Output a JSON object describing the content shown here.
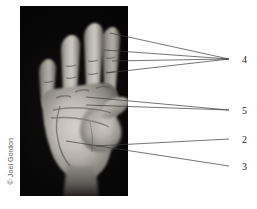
{
  "figure": {
    "kind": "anatomy-photograph",
    "credit": "© Joel Gordon",
    "background_color": "#ffffff",
    "photo": {
      "background_color": "#050505",
      "left": 20,
      "top": 6,
      "width": 108,
      "height": 190
    }
  },
  "callouts": [
    {
      "id": "callout-4",
      "label": "4",
      "label_x": 242,
      "label_y": 55,
      "anchor_x": 229,
      "anchor_y": 59,
      "targets": [
        {
          "x": 110,
          "y": 33
        },
        {
          "x": 104,
          "y": 50
        },
        {
          "x": 112,
          "y": 61
        },
        {
          "x": 106,
          "y": 73
        }
      ]
    },
    {
      "id": "callout-5",
      "label": "5",
      "label_x": 242,
      "label_y": 106,
      "anchor_x": 229,
      "anchor_y": 110,
      "targets": [
        {
          "x": 86,
          "y": 97
        },
        {
          "x": 86,
          "y": 105
        }
      ]
    },
    {
      "id": "callout-2",
      "label": "2",
      "label_x": 242,
      "label_y": 135,
      "anchor_x": 229,
      "anchor_y": 139,
      "targets": [
        {
          "x": 96,
          "y": 146
        }
      ]
    },
    {
      "id": "callout-3",
      "label": "3",
      "label_x": 242,
      "label_y": 162,
      "anchor_x": 229,
      "anchor_y": 166,
      "targets": [
        {
          "x": 66,
          "y": 141
        }
      ]
    }
  ],
  "line_style": {
    "color": "#3a3a3a",
    "width": 0.7
  }
}
